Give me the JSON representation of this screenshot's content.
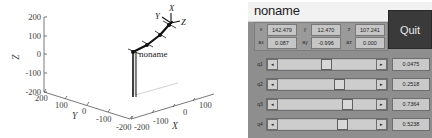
{
  "plot": {
    "robot_label": "noname",
    "axes": {
      "z": {
        "name": "Z",
        "ticks": [
          "200",
          "100",
          "0",
          "-100",
          "-200"
        ]
      },
      "y": {
        "name": "Y",
        "ticks": [
          "200",
          "100",
          "0",
          "-100",
          "-200"
        ]
      },
      "x": {
        "name": "X",
        "ticks": [
          "-200",
          "-100",
          "0",
          "100"
        ]
      }
    },
    "end_effector_frame": {
      "x": "X",
      "y": "Y",
      "z": "Z"
    }
  },
  "panel": {
    "title": "noname",
    "quit_label": "Quit",
    "pose_fields": [
      {
        "label": "x",
        "value": "142.479"
      },
      {
        "label": "y",
        "value": "12.470"
      },
      {
        "label": "z",
        "value": "107.241"
      }
    ],
    "orientation_fields": [
      {
        "label": "ax",
        "value": "0.087"
      },
      {
        "label": "ay",
        "value": "-0.996"
      },
      {
        "label": "az",
        "value": "0.000"
      }
    ],
    "slider_arrows": {
      "left": "◂",
      "right": "▸"
    },
    "joint_sliders": [
      {
        "label": "q1",
        "value": "0.0475",
        "percent": 47
      },
      {
        "label": "q2",
        "value": "0.2518",
        "percent": 62
      },
      {
        "label": "q3",
        "value": "0.7364",
        "percent": 70
      },
      {
        "label": "q4",
        "value": "0.5238",
        "percent": 65
      }
    ]
  }
}
